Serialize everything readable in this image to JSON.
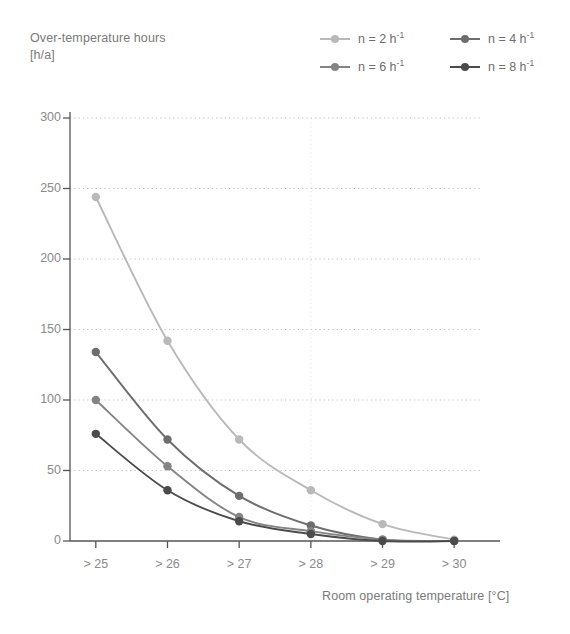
{
  "chart_data": {
    "type": "line",
    "title": "",
    "ylabel": "Over-temperature hours [h/a]",
    "ylabel_lines": [
      "Over-temperature hours",
      "[h/a]"
    ],
    "xlabel": "Room operating temperature [°C]",
    "categories": [
      "> 25",
      "> 26",
      "> 27",
      "> 28",
      "> 29",
      "> 30"
    ],
    "ylim": [
      0,
      300
    ],
    "yticks": [
      0,
      50,
      100,
      150,
      200,
      250,
      300
    ],
    "ytick_labels": [
      "0",
      "50",
      "100",
      "150",
      "200",
      "250",
      "300"
    ],
    "grid": "horizontal dotted gridlines at each y tick; faint vertical gridline at category '> 28'",
    "legend_position": "top-right",
    "series": [
      {
        "name": "n = 2 h⁻¹",
        "label_main": "n = 2 h",
        "label_sup": "-1",
        "color": "#b9b9b9",
        "values": [
          244,
          142,
          72,
          36,
          12,
          1
        ]
      },
      {
        "name": "n = 4 h⁻¹",
        "label_main": "n = 4 h",
        "label_sup": "-1",
        "color": "#6d6d6d",
        "values": [
          134,
          72,
          32,
          11,
          1,
          0
        ]
      },
      {
        "name": "n = 6 h⁻¹",
        "label_main": "n = 6 h",
        "label_sup": "-1",
        "color": "#848484",
        "values": [
          100,
          53,
          17,
          7,
          1,
          0
        ]
      },
      {
        "name": "n = 8 h⁻¹",
        "label_main": "n = 8 h",
        "label_sup": "-1",
        "color": "#4b4b4b",
        "values": [
          76,
          36,
          14,
          5,
          0,
          0
        ]
      }
    ]
  },
  "axis_colors": {
    "axis_line": "#555555",
    "gridline": "#bfbfbf",
    "tick_text": "#8a8a8a",
    "title_text": "#7a7a7a"
  }
}
